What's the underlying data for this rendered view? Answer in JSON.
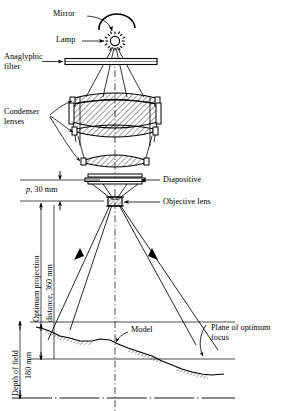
{
  "figure": {
    "type": "technical-line-diagram",
    "background": "#ffffff",
    "ink": "#000000",
    "width": 285,
    "height": 411
  },
  "labels": {
    "mirror": "Mirror",
    "lamp": "Lamp",
    "anaglyphic_filter_line1": "Anaglyphic",
    "anaglyphic_filter_line2": "filter",
    "condenser_line1": "Condenser",
    "condenser_line2": "lenses",
    "diapositive": "Diapositive",
    "objective_lens": "Objective lens",
    "p_dim_prefix": "p",
    "p_dim_rest": ", 30 mm",
    "optimum_projection": "Optimum projection",
    "projection_distance": "distance, 360 mm",
    "depth_of_field": "Depth of field",
    "depth_value": "180 mm",
    "model": "Model",
    "plane_line1": "Plane of optimum",
    "plane_line2": "focus"
  },
  "dimensions": {
    "principal_distance_symbol": "p",
    "principal_distance_value": "30 mm",
    "optimum_projection_distance": "360 mm",
    "depth_of_field": "180 mm"
  },
  "components": [
    "mirror",
    "lamp",
    "anaglyphic-filter",
    "condenser-lens-upper",
    "condenser-lens-middle",
    "condenser-lens-lower",
    "diapositive",
    "objective-lens",
    "model-terrain",
    "plane-of-optimum-focus"
  ]
}
